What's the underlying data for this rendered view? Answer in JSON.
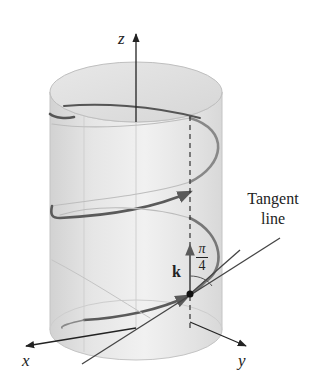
{
  "figure": {
    "type": "3d-helix-on-cylinder",
    "axes": {
      "x_label": "x",
      "y_label": "y",
      "z_label": "z"
    },
    "annotations": {
      "tangent_label_line1": "Tangent",
      "tangent_label_line2": "line",
      "vector_label": "k",
      "angle_numerator": "π",
      "angle_denominator": "4"
    },
    "colors": {
      "helix": "#5a5a5a",
      "cylinder_fill": "#e4e4e4",
      "cylinder_edge": "#bdbdbd",
      "axis": "#222222",
      "tangent": "#444444",
      "text": "#222222"
    }
  }
}
